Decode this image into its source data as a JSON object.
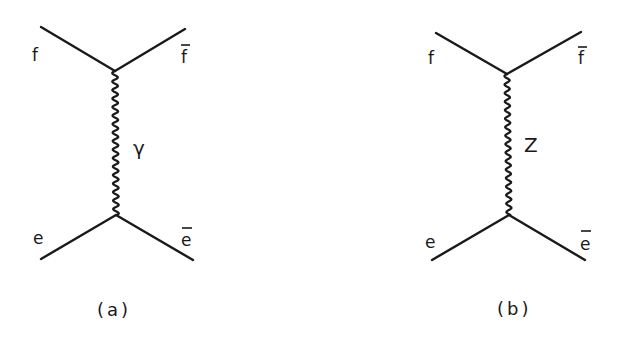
{
  "diagrams": [
    {
      "id": "a",
      "caption": "(a)",
      "boson_label": "γ",
      "boson_type": "photon",
      "labels": {
        "top_left": "f",
        "top_right": "f",
        "top_right_bar": true,
        "bottom_left": "e",
        "bottom_right": "e",
        "bottom_right_bar": true
      },
      "geometry": {
        "top_left": [
          41,
          27
        ],
        "top_vertex": [
          115,
          71
        ],
        "top_right": [
          185,
          29
        ],
        "bottom_vertex": [
          116,
          215
        ],
        "bottom_left": [
          41,
          259
        ],
        "bottom_right": [
          193,
          260
        ]
      }
    },
    {
      "id": "b",
      "caption": "(b)",
      "boson_label": "Z",
      "boson_type": "Z boson",
      "labels": {
        "top_left": "f",
        "top_right": "f",
        "top_right_bar": true,
        "bottom_left": "e",
        "bottom_right": "e",
        "bottom_right_bar": true
      },
      "geometry": {
        "top_left": [
          436,
          33
        ],
        "top_vertex": [
          507,
          74
        ],
        "top_right": [
          581,
          32
        ],
        "bottom_vertex": [
          509,
          215
        ],
        "bottom_left": [
          432,
          260
        ],
        "bottom_right": [
          585,
          260
        ]
      }
    }
  ],
  "style": {
    "ink_color": "#1a1a1a",
    "background": "#ffffff"
  }
}
